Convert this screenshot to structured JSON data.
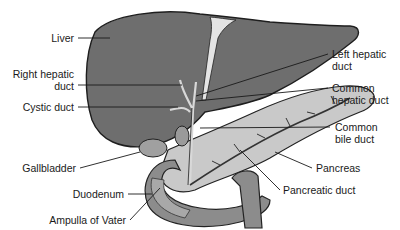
{
  "figure": {
    "colors": {
      "liver": "#6e6e6e",
      "liver_outline": "#1e1e1e",
      "pancreas": "#c8c8c8",
      "duodenum": "#8a8a8a",
      "duct": "#d9d9d9",
      "leader": "#1a1a1a"
    }
  },
  "labels": {
    "left": [
      {
        "id": "liver",
        "text": "Liver"
      },
      {
        "id": "right_hepatic_duct",
        "line1": "Right hepatic",
        "line2": "duct"
      },
      {
        "id": "cystic_duct",
        "text": "Cystic duct"
      },
      {
        "id": "gallbladder",
        "text": "Gallbladder"
      },
      {
        "id": "duodenum",
        "text": "Duodenum"
      },
      {
        "id": "ampulla_of_vater",
        "text": "Ampulla of Vater"
      }
    ],
    "right": [
      {
        "id": "left_hepatic_duct",
        "line1": "Left hepatic",
        "line2": "duct"
      },
      {
        "id": "common_hepatic_duct",
        "line1": "Common",
        "line2": "hepatic duct"
      },
      {
        "id": "common_bile_duct",
        "line1": "Common",
        "line2": "bile duct"
      },
      {
        "id": "pancreas",
        "text": "Pancreas"
      },
      {
        "id": "pancreatic_duct",
        "text": "Pancreatic duct"
      }
    ]
  }
}
